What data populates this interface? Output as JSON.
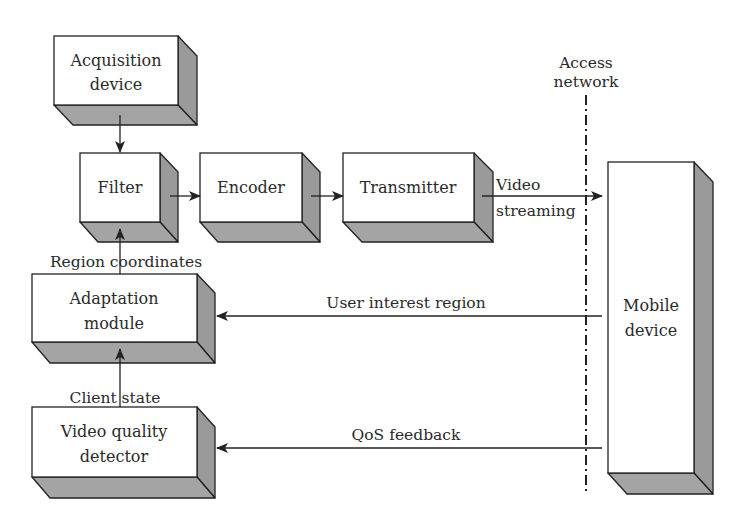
{
  "diagram": {
    "title": "",
    "colors": {
      "front": "#ffffff",
      "shade": "#9a9a9a",
      "stroke": "#222222",
      "text": "#2a2a2a"
    },
    "depth": 19,
    "nodes": [
      {
        "id": "acquisition-device",
        "lines": [
          "Acquisition",
          "device"
        ],
        "x": 54,
        "y": 36,
        "w": 124,
        "h": 69
      },
      {
        "id": "filter",
        "lines": [
          "Filter"
        ],
        "x": 80,
        "y": 153,
        "w": 80,
        "h": 69
      },
      {
        "id": "encoder",
        "lines": [
          "Encoder"
        ],
        "x": 200,
        "y": 153,
        "w": 102,
        "h": 69
      },
      {
        "id": "transmitter",
        "lines": [
          "Transmitter"
        ],
        "x": 343,
        "y": 153,
        "w": 131,
        "h": 69
      },
      {
        "id": "adaptation-module",
        "lines": [
          "Adaptation",
          "module"
        ],
        "x": 32,
        "y": 274,
        "w": 165,
        "h": 68
      },
      {
        "id": "video-quality-detector",
        "lines": [
          "Video quality",
          "detector"
        ],
        "x": 32,
        "y": 407,
        "w": 165,
        "h": 70
      },
      {
        "id": "mobile-device",
        "lines": [
          "Mobile",
          "device"
        ],
        "x": 608,
        "y": 162,
        "w": 86,
        "h": 311
      }
    ],
    "edges": [
      {
        "id": "acquisition-to-filter",
        "from": "acquisition-device",
        "to": "filter",
        "x1": 120,
        "y1": 115,
        "x2": 120,
        "y2": 153,
        "label": ""
      },
      {
        "id": "filter-to-encoder",
        "from": "filter",
        "to": "encoder",
        "x1": 170,
        "y1": 196,
        "x2": 200,
        "y2": 196,
        "label": ""
      },
      {
        "id": "encoder-to-transmitter",
        "from": "encoder",
        "to": "transmitter",
        "x1": 311,
        "y1": 196,
        "x2": 343,
        "y2": 196,
        "label": ""
      },
      {
        "id": "transmitter-to-mobile",
        "from": "transmitter",
        "to": "mobile-device",
        "x1": 482,
        "y1": 196,
        "x2": 602,
        "y2": 196,
        "label": "Video streaming",
        "label_lines": [
          "Video",
          "streaming"
        ]
      },
      {
        "id": "mobile-to-adaptation",
        "from": "mobile-device",
        "to": "adaptation-module",
        "x1": 602,
        "y1": 316,
        "x2": 216,
        "y2": 316,
        "label": "User interest region"
      },
      {
        "id": "mobile-to-video-quality",
        "from": "mobile-device",
        "to": "video-quality-detector",
        "x1": 602,
        "y1": 448,
        "x2": 216,
        "y2": 448,
        "label": "QoS feedback"
      },
      {
        "id": "adaptation-to-filter",
        "from": "adaptation-module",
        "to": "filter",
        "x1": 120,
        "y1": 274,
        "x2": 120,
        "y2": 228,
        "label": "Region coordinates"
      },
      {
        "id": "video-quality-to-adaptation",
        "from": "video-quality-detector",
        "to": "adaptation-module",
        "x1": 120,
        "y1": 407,
        "x2": 120,
        "y2": 348,
        "label": "Client state"
      }
    ],
    "boundary": {
      "label": "Access network",
      "label_lines": [
        "Access",
        "network"
      ],
      "x": 586,
      "y1": 95,
      "y2": 492
    }
  }
}
